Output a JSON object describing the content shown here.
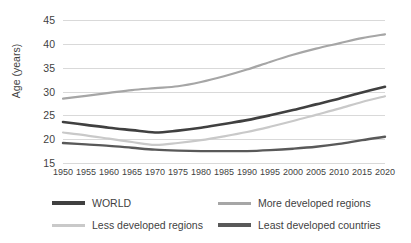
{
  "chart_data": {
    "type": "line",
    "title": "",
    "xlabel": "",
    "ylabel": "Age (years)",
    "ylim": [
      15,
      45
    ],
    "xlim": [
      1950,
      2020
    ],
    "yticks": [
      15,
      20,
      25,
      30,
      35,
      40,
      45
    ],
    "grid": true,
    "legend_position": "bottom",
    "categories": [
      "1950",
      "1955",
      "1960",
      "1965",
      "1970",
      "1975",
      "1980",
      "1985",
      "1990",
      "1995",
      "2000",
      "2005",
      "2010",
      "2015",
      "2020"
    ],
    "x": [
      1950,
      1955,
      1960,
      1965,
      1970,
      1975,
      1980,
      1985,
      1990,
      1995,
      2000,
      2005,
      2010,
      2015,
      2020
    ],
    "series": [
      {
        "name": "WORLD",
        "color": "#404040",
        "width": 2.6,
        "values": [
          23.6,
          23.0,
          22.4,
          21.9,
          21.4,
          21.8,
          22.4,
          23.2,
          24.0,
          25.0,
          26.1,
          27.3,
          28.5,
          29.8,
          31.0
        ]
      },
      {
        "name": "More developed regions",
        "color": "#a6a6a6",
        "width": 2.2,
        "values": [
          28.5,
          29.1,
          29.7,
          30.3,
          30.7,
          31.1,
          32.0,
          33.2,
          34.6,
          36.2,
          37.7,
          39.0,
          40.1,
          41.2,
          42.0
        ]
      },
      {
        "name": "Less developed regions",
        "color": "#c9c9c9",
        "width": 2.2,
        "values": [
          21.4,
          20.8,
          20.1,
          19.4,
          18.8,
          19.2,
          19.8,
          20.6,
          21.5,
          22.6,
          23.8,
          25.1,
          26.4,
          27.8,
          29.0
        ]
      },
      {
        "name": "Least developed countries",
        "color": "#595959",
        "width": 2.4,
        "values": [
          19.2,
          18.9,
          18.6,
          18.2,
          17.8,
          17.6,
          17.5,
          17.5,
          17.5,
          17.7,
          18.0,
          18.4,
          19.0,
          19.8,
          20.5
        ]
      }
    ]
  },
  "legend": {
    "items": [
      {
        "label": "WORLD",
        "color": "#404040"
      },
      {
        "label": "More developed regions",
        "color": "#a6a6a6"
      },
      {
        "label": "Less developed regions",
        "color": "#c9c9c9"
      },
      {
        "label": "Least developed countries",
        "color": "#595959"
      }
    ]
  }
}
